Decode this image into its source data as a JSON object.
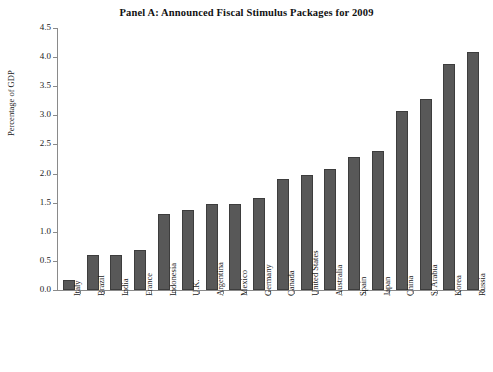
{
  "chart_data": {
    "type": "bar",
    "title": "Panel A: Announced Fiscal Stimulus Packages for 2009",
    "xlabel": "",
    "ylabel": "Percentage of GDP",
    "ylim": [
      0.0,
      4.5
    ],
    "ytick_labels": [
      "0.0",
      "0.5",
      "1.0",
      "1.5",
      "2.0",
      "2.5",
      "3.0",
      "3.5",
      "4.0",
      "4.5"
    ],
    "ytick_values": [
      0.0,
      0.5,
      1.0,
      1.5,
      2.0,
      2.5,
      3.0,
      3.5,
      4.0,
      4.5
    ],
    "grid": false,
    "legend": null,
    "bar_color": "#585858",
    "bar_edge_color": "#3d3d3d",
    "categories": [
      "Italy",
      "Brazil",
      "India",
      "France",
      "Indonesia",
      "U.K.",
      "Argentina",
      "Mexico",
      "Germany",
      "Canada",
      "United States",
      "Australia",
      "Spain",
      "Japan",
      "China",
      "S. Arabia",
      "Korea",
      "Russia"
    ],
    "values": [
      0.18,
      0.6,
      0.6,
      0.68,
      1.3,
      1.38,
      1.48,
      1.48,
      1.58,
      1.9,
      1.98,
      2.08,
      2.28,
      2.38,
      3.08,
      3.28,
      3.88,
      4.08
    ]
  }
}
